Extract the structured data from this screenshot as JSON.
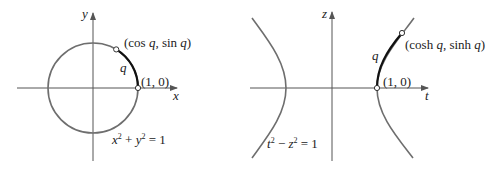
{
  "colors": {
    "axis": "#555555",
    "curve": "#6e6e6e",
    "arc_highlight": "#111111",
    "text": "#222222",
    "background": "#ffffff"
  },
  "left_diagram": {
    "x_axis_label": "x",
    "y_axis_label": "y",
    "point_start_label": "(1, 0)",
    "point_end_label": "(cos q, sin q)",
    "point_end_parts": {
      "open": "(cos ",
      "var1": "q",
      "mid": ", sin ",
      "var2": "q",
      "close": ")"
    },
    "arc_label": "q",
    "equation": "x² + y² = 1",
    "equation_parts": {
      "a": "x",
      "a_exp": "2",
      "op": " + ",
      "b": "y",
      "b_exp": "2",
      "rhs": " = 1"
    }
  },
  "right_diagram": {
    "x_axis_label": "t",
    "y_axis_label": "z",
    "point_start_label": "(1, 0)",
    "point_end_label": "(cosh q, sinh q)",
    "point_end_parts": {
      "open": "(cosh ",
      "var1": "q",
      "mid": ", sinh ",
      "var2": "q",
      "close": ")"
    },
    "arc_label": "q",
    "equation": "t² − z² = 1",
    "equation_parts": {
      "a": "t",
      "a_exp": "2",
      "op": " − ",
      "b": "z",
      "b_exp": "2",
      "rhs": " = 1"
    }
  }
}
